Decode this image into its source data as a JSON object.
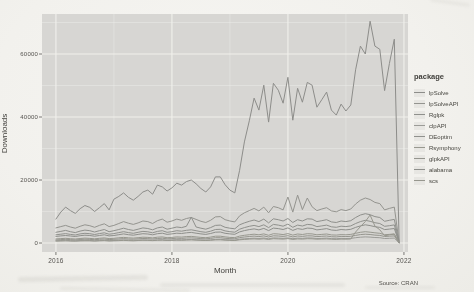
{
  "figure": {
    "source_caption": "Source: CRAN"
  },
  "chart_data": {
    "type": "line",
    "title": "",
    "xlabel": "Month",
    "ylabel": "Downloads",
    "legend_title": "package",
    "legend_position": "right",
    "grid": "major+minor",
    "panel_background": "#d7d6d3",
    "gridline_color": "#f1f0ec",
    "tick_color": "#5a5955",
    "x_start": "2016-01",
    "x_months_per_point": 1,
    "x_tick_labels": [
      "2016",
      "2018",
      "2020",
      "2022"
    ],
    "x_tick_years": [
      2016,
      2018,
      2020,
      2022
    ],
    "x_minor_years": [
      2017,
      2019,
      2021
    ],
    "y_tick_labels": [
      "0",
      "20000",
      "40000",
      "60000"
    ],
    "y_tick_values": [
      0,
      20000,
      40000,
      60000
    ],
    "y_minor_values": [
      10000,
      30000,
      50000,
      70000
    ],
    "xlim": [
      2015.76,
      2022.07
    ],
    "ylim": [
      -2850,
      72700
    ],
    "series": [
      {
        "name": "lpSolve",
        "color": "#8d8d8a",
        "values": [
          7600,
          9800,
          11400,
          10300,
          9400,
          10900,
          11900,
          11300,
          10000,
          11200,
          12500,
          10500,
          13900,
          14800,
          15900,
          14500,
          13600,
          14800,
          16200,
          16800,
          15500,
          18400,
          17800,
          16500,
          17500,
          19000,
          18400,
          19500,
          20000,
          18800,
          17300,
          16200,
          17800,
          21000,
          21000,
          18500,
          16800,
          15900,
          23100,
          32100,
          38800,
          46000,
          42200,
          50100,
          38400,
          50700,
          48500,
          44400,
          52600,
          39000,
          49100,
          44700,
          51000,
          50100,
          43100,
          45500,
          47900,
          42200,
          40600,
          44100,
          41900,
          43800,
          55000,
          62500,
          60000,
          70400,
          62500,
          61500,
          48400,
          57000,
          64700,
          800
        ]
      },
      {
        "name": "lpSolveAPI",
        "color": "#94948f",
        "values": [
          4800,
          5200,
          5600,
          5100,
          4700,
          5300,
          5800,
          5500,
          5000,
          5600,
          6100,
          5200,
          5600,
          6200,
          6800,
          6300,
          5900,
          6400,
          7000,
          6800,
          6200,
          7100,
          7600,
          6600,
          7000,
          7600,
          7200,
          7800,
          8100,
          7500,
          6900,
          6500,
          7200,
          8300,
          8400,
          7400,
          7000,
          6700,
          8600,
          9600,
          10300,
          11000,
          10200,
          11400,
          9600,
          11600,
          11200,
          10500,
          14600,
          9800,
          15200,
          10600,
          14300,
          11500,
          10300,
          10800,
          11200,
          10200,
          9900,
          10600,
          10300,
          10800,
          12400,
          13600,
          14300,
          13800,
          12900,
          12500,
          10500,
          11000,
          11400,
          300
        ]
      },
      {
        "name": "Rglpk",
        "color": "#8f908c",
        "values": [
          3400,
          3700,
          4000,
          3600,
          3300,
          3800,
          4100,
          3900,
          3500,
          3900,
          4300,
          3600,
          3900,
          4300,
          4700,
          4300,
          4000,
          4400,
          4800,
          4600,
          4200,
          4800,
          5100,
          4400,
          4700,
          5100,
          4900,
          5300,
          8200,
          5100,
          4700,
          4400,
          4900,
          5600,
          5700,
          5000,
          4700,
          4500,
          5800,
          6400,
          6900,
          7300,
          6800,
          7600,
          6400,
          7700,
          7400,
          7000,
          7800,
          6500,
          7400,
          7000,
          7700,
          7600,
          6800,
          7100,
          7400,
          6700,
          6500,
          7000,
          6800,
          7100,
          8100,
          8900,
          9300,
          9000,
          8400,
          8100,
          6900,
          7200,
          7500,
          250
        ]
      },
      {
        "name": "clpAPI",
        "color": "#9b9b97",
        "values": [
          700,
          800,
          900,
          750,
          700,
          800,
          850,
          800,
          720,
          800,
          900,
          760,
          800,
          900,
          980,
          900,
          840,
          920,
          1000,
          960,
          880,
          1000,
          1060,
          920,
          980,
          1060,
          1020,
          1100,
          1140,
          1060,
          980,
          920,
          1020,
          1160,
          1180,
          1040,
          980,
          940,
          1200,
          1340,
          1440,
          1530,
          1420,
          1590,
          1340,
          1610,
          1550,
          1460,
          1630,
          1360,
          1550,
          1460,
          1610,
          1580,
          1420,
          1480,
          1550,
          1400,
          1360,
          1460,
          1420,
          1480,
          1690,
          1860,
          1950,
          1880,
          1760,
          1690,
          1440,
          1500,
          1570,
          60
        ]
      },
      {
        "name": "DEoptim",
        "color": "#90918d",
        "values": [
          2600,
          2800,
          3000,
          2750,
          2550,
          2900,
          3100,
          2950,
          2700,
          3000,
          3250,
          2800,
          3000,
          3300,
          3600,
          3300,
          3100,
          3400,
          3700,
          3550,
          3250,
          3700,
          3900,
          3400,
          3600,
          3900,
          3750,
          4050,
          4200,
          3900,
          3600,
          3400,
          3750,
          4300,
          4350,
          3850,
          3600,
          3450,
          4400,
          4900,
          5300,
          5600,
          5200,
          5800,
          4900,
          5900,
          5700,
          5350,
          6000,
          5000,
          5700,
          5400,
          5900,
          5800,
          5200,
          5450,
          5700,
          5150,
          5000,
          5350,
          5200,
          5450,
          6200,
          6800,
          7200,
          6900,
          6450,
          6200,
          5300,
          5500,
          5750,
          190
        ]
      },
      {
        "name": "Rsymphony",
        "color": "#98988f",
        "values": [
          1300,
          1400,
          1500,
          1380,
          1280,
          1450,
          1550,
          1480,
          1350,
          1500,
          1630,
          1400,
          1500,
          1650,
          1800,
          1650,
          1550,
          1700,
          1850,
          1780,
          1630,
          1850,
          1950,
          1700,
          1800,
          1950,
          1880,
          2030,
          2100,
          1950,
          1800,
          1700,
          1880,
          2150,
          2180,
          1930,
          1800,
          1730,
          2200,
          2450,
          2650,
          2800,
          2600,
          2900,
          2450,
          2950,
          2850,
          2680,
          3000,
          2500,
          2850,
          2700,
          2950,
          2900,
          2600,
          2730,
          2850,
          2580,
          2500,
          2680,
          2600,
          2730,
          3100,
          3400,
          3600,
          3450,
          3230,
          3100,
          2650,
          2750,
          2880,
          95
        ]
      },
      {
        "name": "glpkAPI",
        "color": "#95958e",
        "values": [
          1000,
          1100,
          1180,
          1080,
          1000,
          1130,
          1210,
          1160,
          1060,
          1170,
          1280,
          1090,
          1170,
          1290,
          1400,
          1290,
          1210,
          1330,
          1450,
          1390,
          1270,
          1450,
          1520,
          1330,
          1400,
          1520,
          1470,
          1580,
          1640,
          1520,
          1400,
          1330,
          1470,
          1680,
          1700,
          1510,
          1400,
          1350,
          1720,
          1910,
          2070,
          2190,
          2030,
          2270,
          1910,
          2300,
          2220,
          2090,
          2340,
          1950,
          2220,
          2110,
          2300,
          2260,
          2030,
          2130,
          2220,
          2010,
          1950,
          2090,
          2030,
          2130,
          2420,
          2660,
          2810,
          2690,
          2520,
          2420,
          2070,
          2150,
          2250,
          75
        ]
      },
      {
        "name": "alabama",
        "color": "#8e8f8b",
        "values": [
          2100,
          2250,
          2400,
          2220,
          2060,
          2330,
          2490,
          2380,
          2170,
          2400,
          2610,
          2250,
          2400,
          2650,
          2890,
          2650,
          2490,
          2730,
          2970,
          2850,
          2610,
          2970,
          3130,
          2730,
          2890,
          3130,
          3010,
          3250,
          3370,
          3130,
          2890,
          2730,
          3010,
          3450,
          3490,
          3090,
          2890,
          2770,
          3530,
          3930,
          4250,
          4490,
          4170,
          4650,
          3930,
          4730,
          4570,
          4290,
          4810,
          4010,
          4570,
          4330,
          4730,
          4650,
          4170,
          4370,
          4570,
          4130,
          4010,
          4290,
          4170,
          4370,
          4970,
          5450,
          5770,
          5530,
          5170,
          4970,
          4250,
          4410,
          4610,
          150
        ]
      },
      {
        "name": "scs",
        "color": "#97978e",
        "values": [
          600,
          650,
          700,
          640,
          600,
          670,
          720,
          690,
          630,
          700,
          760,
          650,
          700,
          770,
          840,
          770,
          720,
          790,
          860,
          830,
          760,
          860,
          910,
          790,
          840,
          910,
          870,
          940,
          980,
          910,
          840,
          790,
          870,
          1000,
          1010,
          900,
          840,
          800,
          1020,
          1140,
          1230,
          1300,
          1210,
          1350,
          1140,
          1370,
          1320,
          1240,
          1390,
          1160,
          1320,
          1250,
          1370,
          1350,
          1210,
          1270,
          1320,
          1200,
          1160,
          1240,
          1210,
          1270,
          3500,
          5200,
          6800,
          8900,
          5400,
          4200,
          2300,
          2600,
          2800,
          45
        ]
      }
    ]
  }
}
